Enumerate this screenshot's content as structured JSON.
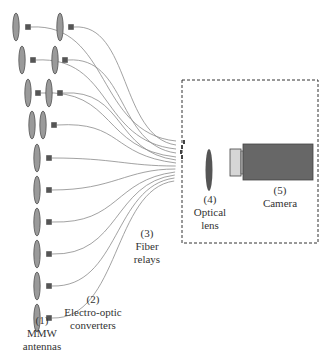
{
  "diagram": {
    "colors": {
      "antenna_fill": "#9a9a9a",
      "antenna_stroke": "#444444",
      "converter_fill": "#555555",
      "fiber": "#8a8a8a",
      "lens_fill": "#555555",
      "camera_body": "#676767",
      "camera_adapter": "#d6d6d6",
      "box_border": "#333333",
      "text": "#333333"
    },
    "components": [
      {
        "id": "antennas",
        "number": "(1)",
        "name_line1": "MMW",
        "name_line2": "antennas"
      },
      {
        "id": "converters",
        "number": "(2)",
        "name_line1": "Electro-optic",
        "name_line2": "converters"
      },
      {
        "id": "fibers",
        "number": "(3)",
        "name_line1": "Fiber",
        "name_line2": "relays"
      },
      {
        "id": "lens",
        "number": "(4)",
        "name_line1": "Optical",
        "name_line2": "lens"
      },
      {
        "id": "camera",
        "number": "(5)",
        "name_line1": "Camera",
        "name_line2": ""
      }
    ],
    "antenna_rows": [
      {
        "y": 27,
        "ellipses": [
          16,
          60
        ],
        "squares": [
          28,
          71
        ]
      },
      {
        "y": 60,
        "ellipses": [
          22,
          55
        ],
        "squares": [
          33,
          65
        ]
      },
      {
        "y": 93,
        "ellipses": [
          28,
          49
        ],
        "squares": [
          38,
          60
        ]
      },
      {
        "y": 125,
        "ellipses": [
          32,
          43
        ],
        "squares": [
          54
        ]
      },
      {
        "y": 158,
        "ellipses": [
          37
        ],
        "squares": [
          49
        ]
      },
      {
        "y": 190,
        "ellipses": [
          37
        ],
        "squares": [
          49
        ]
      },
      {
        "y": 222,
        "ellipses": [
          37
        ],
        "squares": [
          49
        ]
      },
      {
        "y": 254,
        "ellipses": [
          37
        ],
        "squares": [
          49
        ]
      },
      {
        "y": 286,
        "ellipses": [
          37
        ],
        "squares": [
          49
        ]
      },
      {
        "y": 318,
        "ellipses": [
          37
        ],
        "squares": [
          49
        ]
      }
    ],
    "fiber_ends": [
      141,
      145,
      149,
      153,
      157,
      160,
      163,
      166,
      169,
      172,
      175,
      178,
      181,
      184,
      187
    ]
  }
}
